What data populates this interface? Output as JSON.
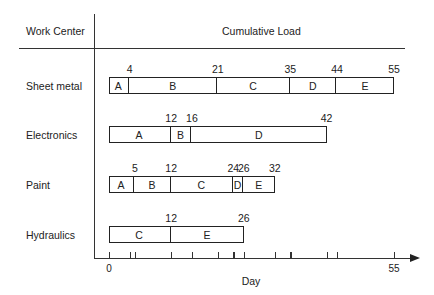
{
  "header": {
    "left_column": "Work Center",
    "right_column": "Cumulative Load"
  },
  "axis": {
    "label": "Day",
    "tick_labels": [
      "0",
      "55"
    ],
    "range": [
      0,
      55
    ],
    "ticks": [
      0,
      4,
      5,
      12,
      16,
      21,
      24,
      26,
      32,
      35,
      42,
      44,
      55
    ]
  },
  "rows": [
    {
      "label": "Sheet metal",
      "segments": [
        {
          "job": "A",
          "start": 0,
          "end": 4
        },
        {
          "job": "B",
          "start": 4,
          "end": 21
        },
        {
          "job": "C",
          "start": 21,
          "end": 35
        },
        {
          "job": "D",
          "start": 35,
          "end": 44
        },
        {
          "job": "E",
          "start": 44,
          "end": 55
        }
      ],
      "boundary_labels": [
        "4",
        "21",
        "35",
        "44",
        "55"
      ]
    },
    {
      "label": "Electronics",
      "segments": [
        {
          "job": "A",
          "start": 0,
          "end": 12
        },
        {
          "job": "B",
          "start": 12,
          "end": 16
        },
        {
          "job": "D",
          "start": 16,
          "end": 42
        }
      ],
      "boundary_labels": [
        "12",
        "16",
        "42"
      ]
    },
    {
      "label": "Paint",
      "segments": [
        {
          "job": "A",
          "start": 0,
          "end": 5
        },
        {
          "job": "B",
          "start": 5,
          "end": 12
        },
        {
          "job": "C",
          "start": 12,
          "end": 24
        },
        {
          "job": "D",
          "start": 24,
          "end": 26
        },
        {
          "job": "E",
          "start": 26,
          "end": 32
        }
      ],
      "boundary_labels": [
        "5",
        "12",
        "24",
        "26",
        "32"
      ]
    },
    {
      "label": "Hydraulics",
      "segments": [
        {
          "job": "C",
          "start": 0,
          "end": 12
        },
        {
          "job": "E",
          "start": 12,
          "end": 26
        }
      ],
      "boundary_labels": [
        "12",
        "26"
      ]
    }
  ],
  "chart_data": {
    "type": "bar",
    "subtype": "stacked-horizontal (Gantt load chart)",
    "title": "",
    "xlabel": "Day",
    "ylabel": "Work Center",
    "column_header": "Cumulative Load",
    "xlim": [
      0,
      55
    ],
    "categories": [
      "Sheet metal",
      "Electronics",
      "Paint",
      "Hydraulics"
    ],
    "series": [
      {
        "name": "A",
        "values": [
          4,
          12,
          5,
          0
        ]
      },
      {
        "name": "B",
        "values": [
          17,
          4,
          7,
          0
        ]
      },
      {
        "name": "C",
        "values": [
          14,
          0,
          12,
          12
        ]
      },
      {
        "name": "D",
        "values": [
          9,
          26,
          2,
          0
        ]
      },
      {
        "name": "E",
        "values": [
          11,
          0,
          6,
          14
        ]
      }
    ],
    "cumulative_totals": [
      55,
      42,
      32,
      26
    ],
    "grid": false,
    "legend": "none (job letters labeled inside segments)"
  }
}
